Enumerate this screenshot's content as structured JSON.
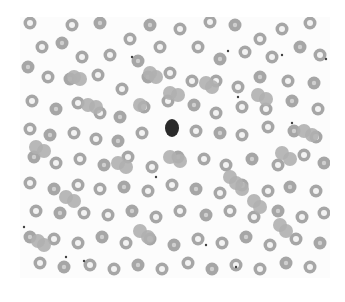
{
  "image": {
    "subject": "blood smear micrograph",
    "palette": {
      "background": "#fcfcfc",
      "cell_ring": "#a6a6a6",
      "cell_fill_solid": "#b0b0b0",
      "cell_center": "#f2f2f2",
      "dark_cell": "#2a2a2a",
      "platelet": "#404040"
    },
    "dark_cell": {
      "cx": 152,
      "cy": 111,
      "rx": 7,
      "ry": 9
    },
    "cells": [
      [
        10,
        6,
        1
      ],
      [
        52,
        8,
        1
      ],
      [
        80,
        6,
        0
      ],
      [
        110,
        22,
        1
      ],
      [
        130,
        8,
        0
      ],
      [
        160,
        12,
        1
      ],
      [
        190,
        5,
        1
      ],
      [
        215,
        8,
        0
      ],
      [
        240,
        22,
        1
      ],
      [
        262,
        12,
        1
      ],
      [
        290,
        6,
        1
      ],
      [
        22,
        30,
        1
      ],
      [
        42,
        26,
        0
      ],
      [
        62,
        40,
        1
      ],
      [
        90,
        38,
        1
      ],
      [
        118,
        44,
        0
      ],
      [
        140,
        30,
        1
      ],
      [
        178,
        30,
        1
      ],
      [
        200,
        42,
        0
      ],
      [
        225,
        35,
        1
      ],
      [
        252,
        40,
        1
      ],
      [
        280,
        30,
        0
      ],
      [
        300,
        38,
        1
      ],
      [
        8,
        50,
        0
      ],
      [
        28,
        60,
        1
      ],
      [
        50,
        62,
        0
      ],
      [
        78,
        58,
        1
      ],
      [
        102,
        72,
        1
      ],
      [
        128,
        60,
        0
      ],
      [
        150,
        56,
        1
      ],
      [
        172,
        64,
        1
      ],
      [
        196,
        64,
        1
      ],
      [
        218,
        70,
        1
      ],
      [
        240,
        60,
        0
      ],
      [
        268,
        64,
        1
      ],
      [
        294,
        66,
        0
      ],
      [
        12,
        84,
        1
      ],
      [
        36,
        92,
        0
      ],
      [
        58,
        86,
        1
      ],
      [
        80,
        96,
        1
      ],
      [
        100,
        100,
        0
      ],
      [
        124,
        90,
        1
      ],
      [
        148,
        84,
        1
      ],
      [
        174,
        88,
        0
      ],
      [
        196,
        96,
        1
      ],
      [
        222,
        90,
        1
      ],
      [
        246,
        92,
        1
      ],
      [
        272,
        84,
        0
      ],
      [
        298,
        92,
        1
      ],
      [
        10,
        112,
        1
      ],
      [
        30,
        118,
        0
      ],
      [
        54,
        116,
        1
      ],
      [
        76,
        122,
        1
      ],
      [
        98,
        124,
        0
      ],
      [
        122,
        116,
        1
      ],
      [
        176,
        114,
        1
      ],
      [
        200,
        116,
        0
      ],
      [
        222,
        118,
        1
      ],
      [
        248,
        110,
        1
      ],
      [
        274,
        114,
        0
      ],
      [
        296,
        120,
        1
      ],
      [
        14,
        140,
        0
      ],
      [
        36,
        146,
        1
      ],
      [
        60,
        142,
        1
      ],
      [
        84,
        148,
        0
      ],
      [
        108,
        140,
        1
      ],
      [
        132,
        150,
        1
      ],
      [
        158,
        140,
        0
      ],
      [
        184,
        142,
        1
      ],
      [
        206,
        148,
        1
      ],
      [
        232,
        142,
        0
      ],
      [
        258,
        148,
        1
      ],
      [
        284,
        138,
        1
      ],
      [
        304,
        146,
        0
      ],
      [
        10,
        166,
        1
      ],
      [
        34,
        172,
        0
      ],
      [
        58,
        168,
        1
      ],
      [
        80,
        172,
        1
      ],
      [
        104,
        170,
        0
      ],
      [
        128,
        174,
        1
      ],
      [
        152,
        168,
        1
      ],
      [
        176,
        172,
        0
      ],
      [
        200,
        176,
        1
      ],
      [
        222,
        168,
        1
      ],
      [
        248,
        174,
        1
      ],
      [
        270,
        170,
        0
      ],
      [
        296,
        174,
        1
      ],
      [
        16,
        194,
        1
      ],
      [
        40,
        196,
        0
      ],
      [
        64,
        196,
        1
      ],
      [
        88,
        198,
        1
      ],
      [
        112,
        194,
        0
      ],
      [
        136,
        200,
        1
      ],
      [
        160,
        194,
        1
      ],
      [
        186,
        198,
        0
      ],
      [
        210,
        194,
        1
      ],
      [
        234,
        200,
        1
      ],
      [
        258,
        194,
        0
      ],
      [
        282,
        200,
        1
      ],
      [
        304,
        196,
        1
      ],
      [
        10,
        220,
        0
      ],
      [
        34,
        222,
        1
      ],
      [
        58,
        226,
        1
      ],
      [
        82,
        220,
        0
      ],
      [
        106,
        226,
        1
      ],
      [
        130,
        222,
        1
      ],
      [
        154,
        228,
        0
      ],
      [
        178,
        222,
        1
      ],
      [
        202,
        226,
        1
      ],
      [
        226,
        220,
        0
      ],
      [
        250,
        228,
        1
      ],
      [
        276,
        222,
        1
      ],
      [
        300,
        226,
        0
      ],
      [
        20,
        246,
        1
      ],
      [
        44,
        250,
        0
      ],
      [
        70,
        248,
        1
      ],
      [
        94,
        252,
        1
      ],
      [
        118,
        248,
        0
      ],
      [
        142,
        252,
        1
      ],
      [
        168,
        246,
        1
      ],
      [
        192,
        252,
        0
      ],
      [
        216,
        248,
        1
      ],
      [
        240,
        252,
        1
      ],
      [
        266,
        246,
        0
      ],
      [
        290,
        250,
        1
      ]
    ],
    "solid_cells": [
      [
        54,
        60
      ],
      [
        60,
        62
      ],
      [
        68,
        88
      ],
      [
        76,
        90
      ],
      [
        120,
        88
      ],
      [
        130,
        56
      ],
      [
        136,
        60
      ],
      [
        150,
        76
      ],
      [
        158,
        78
      ],
      [
        186,
        66
      ],
      [
        192,
        70
      ],
      [
        238,
        78
      ],
      [
        246,
        82
      ],
      [
        16,
        130
      ],
      [
        24,
        134
      ],
      [
        98,
        146
      ],
      [
        106,
        150
      ],
      [
        150,
        140
      ],
      [
        160,
        144
      ],
      [
        262,
        136
      ],
      [
        270,
        142
      ],
      [
        284,
        114
      ],
      [
        292,
        118
      ],
      [
        46,
        180
      ],
      [
        54,
        184
      ],
      [
        210,
        160
      ],
      [
        216,
        166
      ],
      [
        222,
        172
      ],
      [
        234,
        184
      ],
      [
        240,
        190
      ],
      [
        120,
        214
      ],
      [
        128,
        220
      ],
      [
        18,
        224
      ],
      [
        24,
        228
      ],
      [
        260,
        208
      ],
      [
        266,
        214
      ]
    ],
    "platelets": [
      [
        112,
        40
      ],
      [
        208,
        34
      ],
      [
        262,
        38
      ],
      [
        218,
        80
      ],
      [
        306,
        42
      ],
      [
        136,
        160
      ],
      [
        272,
        106
      ],
      [
        186,
        228
      ],
      [
        216,
        250
      ],
      [
        46,
        240
      ],
      [
        64,
        244
      ],
      [
        4,
        210
      ]
    ]
  }
}
